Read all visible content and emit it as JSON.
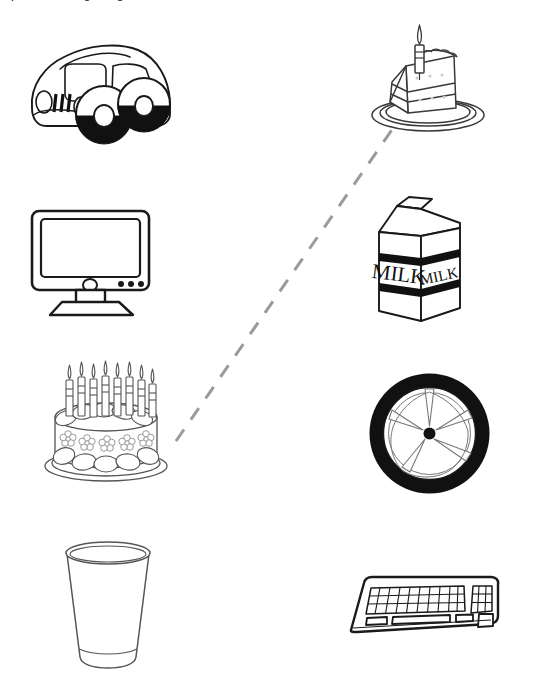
{
  "canvas": {
    "width": 538,
    "height": 686,
    "background": "#ffffff"
  },
  "header": {
    "clipped_text": "mple:  matching things"
  },
  "items": [
    {
      "id": "car",
      "name": "car-illustration",
      "label": "car",
      "column": "left",
      "row": 1,
      "x": 18,
      "y": 22,
      "width": 165,
      "height": 125,
      "stroke": "#1a1a1a",
      "fill": "#ffffff"
    },
    {
      "id": "cake-slice",
      "name": "cake-slice-illustration",
      "label": "slice of cake",
      "column": "right",
      "row": 1,
      "x": 362,
      "y": 20,
      "width": 132,
      "height": 118,
      "stroke": "#3a3a3a",
      "fill": "#ffffff"
    },
    {
      "id": "television",
      "name": "television-illustration",
      "label": "television",
      "column": "left",
      "row": 2,
      "x": 28,
      "y": 207,
      "width": 125,
      "height": 112,
      "stroke": "#1a1a1a",
      "fill": "#ffffff"
    },
    {
      "id": "milk-carton",
      "name": "milk-carton-illustration",
      "label": "milk carton",
      "column": "right",
      "row": 2,
      "x": 366,
      "y": 190,
      "width": 100,
      "height": 142,
      "stroke": "#1a1a1a",
      "fill": "#ffffff",
      "front_text": "MILK",
      "side_text": "MILK"
    },
    {
      "id": "birthday-cake",
      "name": "birthday-cake-illustration",
      "label": "birthday cake",
      "column": "left",
      "row": 3,
      "x": 36,
      "y": 362,
      "width": 140,
      "height": 125,
      "stroke": "#555555",
      "fill": "#ffffff",
      "candle_count": 8,
      "flower_count": 5
    },
    {
      "id": "wheel",
      "name": "wheel-illustration",
      "label": "wheel",
      "column": "right",
      "row": 3,
      "x": 367,
      "y": 371,
      "width": 125,
      "height": 125,
      "stroke": "#1a1a1a",
      "tire_color": "#111111",
      "fill": "#ffffff",
      "spoke_count": 5
    },
    {
      "id": "cup",
      "name": "cup-illustration",
      "label": "cup",
      "column": "left",
      "row": 4,
      "x": 62,
      "y": 541,
      "width": 92,
      "height": 130,
      "stroke": "#555555",
      "fill": "#ffffff"
    },
    {
      "id": "keyboard",
      "name": "keyboard-illustration",
      "label": "keyboard",
      "column": "right",
      "row": 4,
      "x": 331,
      "y": 570,
      "width": 172,
      "height": 80,
      "stroke": "#1a1a1a",
      "fill": "#ffffff"
    }
  ],
  "connector": {
    "name": "matching-line",
    "from_item": "birthday-cake",
    "to_item": "cake-slice",
    "x1": 176,
    "y1": 441,
    "x2": 396,
    "y2": 124,
    "color": "#9a9a9a",
    "stroke_width": 3,
    "dash_length": 14,
    "gap_length": 12,
    "style": "dashed"
  }
}
